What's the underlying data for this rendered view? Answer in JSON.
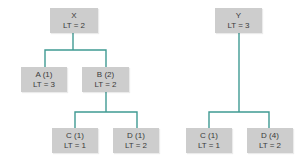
{
  "diagram": {
    "colors": {
      "connector": "#3f9a93",
      "node_fill": "#cdcdcd",
      "text": "#3a3a3a"
    },
    "trees": [
      {
        "root": {
          "id": "X",
          "title": "X",
          "lt": "LT = 2"
        },
        "children": [
          {
            "id": "A",
            "title": "A (1)",
            "lt": "LT = 3"
          },
          {
            "id": "B",
            "title": "B (2)",
            "lt": "LT = 2",
            "children": [
              {
                "id": "C",
                "title": "C (1)",
                "lt": "LT = 1"
              },
              {
                "id": "D",
                "title": "D (1)",
                "lt": "LT = 2"
              }
            ]
          }
        ]
      },
      {
        "root": {
          "id": "Y",
          "title": "Y",
          "lt": "LT = 3"
        },
        "children": [
          {
            "id": "C",
            "title": "C (1)",
            "lt": "LT = 1"
          },
          {
            "id": "D",
            "title": "D (4)",
            "lt": "LT = 2"
          }
        ]
      }
    ]
  }
}
